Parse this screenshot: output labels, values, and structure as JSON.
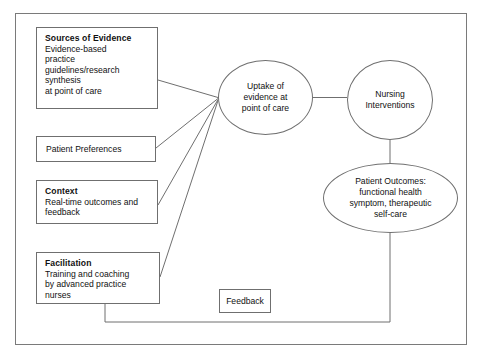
{
  "diagram": {
    "frame_color": "#7a7a7a",
    "line_color": "#6f6f6f",
    "background": "#ffffff",
    "text_color": "#111111"
  },
  "boxes": {
    "sources": {
      "heading": "Sources of Evidence",
      "lines": [
        "Evidence-based",
        "practice",
        "guidelines/research",
        "synthesis",
        "at point of care"
      ]
    },
    "patient_preferences": {
      "heading": "",
      "lines": [
        "Patient Preferences"
      ]
    },
    "context": {
      "heading": "Context",
      "lines": [
        "Real-time outcomes and",
        "feedback"
      ]
    },
    "facilitation": {
      "heading": "Facilitation",
      "lines": [
        "Training and coaching",
        "by advanced practice",
        "nurses"
      ]
    },
    "feedback": {
      "heading": "",
      "lines": [
        "Feedback"
      ]
    }
  },
  "ellipses": {
    "uptake": {
      "lines": [
        "Uptake of",
        "evidence at",
        "point of care"
      ]
    },
    "nursing": {
      "lines": [
        "Nursing",
        "Interventions"
      ]
    },
    "outcomes": {
      "lines": [
        "Patient Outcomes:",
        "functional health",
        "symptom, therapeutic",
        "self-care"
      ]
    }
  },
  "connectors": [
    {
      "name": "sources-to-uptake",
      "from": "sources",
      "to": "uptake",
      "style": "solid"
    },
    {
      "name": "patient-preferences-to-uptake",
      "from": "patient_preferences",
      "to": "uptake",
      "style": "solid"
    },
    {
      "name": "context-to-uptake",
      "from": "context",
      "to": "uptake",
      "style": "solid"
    },
    {
      "name": "facilitation-to-uptake",
      "from": "facilitation",
      "to": "uptake",
      "style": "solid"
    },
    {
      "name": "uptake-to-nursing",
      "from": "uptake",
      "to": "nursing",
      "style": "solid"
    },
    {
      "name": "nursing-to-outcomes",
      "from": "nursing",
      "to": "outcomes",
      "style": "solid"
    },
    {
      "name": "outcomes-feedback-loop",
      "from": "outcomes",
      "to": "facilitation",
      "style": "solid"
    }
  ]
}
